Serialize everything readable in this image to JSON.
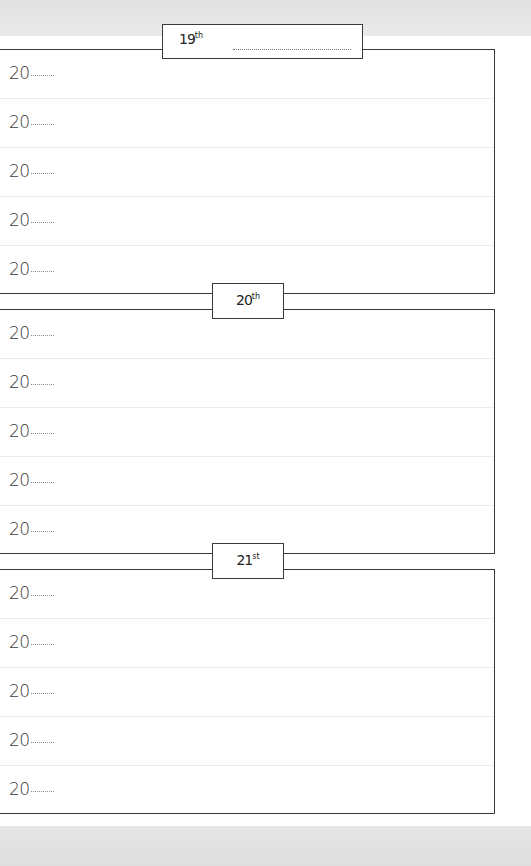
{
  "page": {
    "background_color": "#ffffff",
    "frame_color": "#3a3a3a",
    "margin_color": "#e4e4e4"
  },
  "sections": [
    {
      "day": "19",
      "suffix": "th",
      "has_month_line": true,
      "rows": [
        {
          "year_prefix": "20"
        },
        {
          "year_prefix": "20"
        },
        {
          "year_prefix": "20"
        },
        {
          "year_prefix": "20"
        },
        {
          "year_prefix": "20"
        }
      ]
    },
    {
      "day": "20",
      "suffix": "th",
      "has_month_line": false,
      "rows": [
        {
          "year_prefix": "20"
        },
        {
          "year_prefix": "20"
        },
        {
          "year_prefix": "20"
        },
        {
          "year_prefix": "20"
        },
        {
          "year_prefix": "20"
        }
      ]
    },
    {
      "day": "21",
      "suffix": "st",
      "has_month_line": false,
      "rows": [
        {
          "year_prefix": "20"
        },
        {
          "year_prefix": "20"
        },
        {
          "year_prefix": "20"
        },
        {
          "year_prefix": "20"
        },
        {
          "year_prefix": "20"
        }
      ]
    }
  ]
}
